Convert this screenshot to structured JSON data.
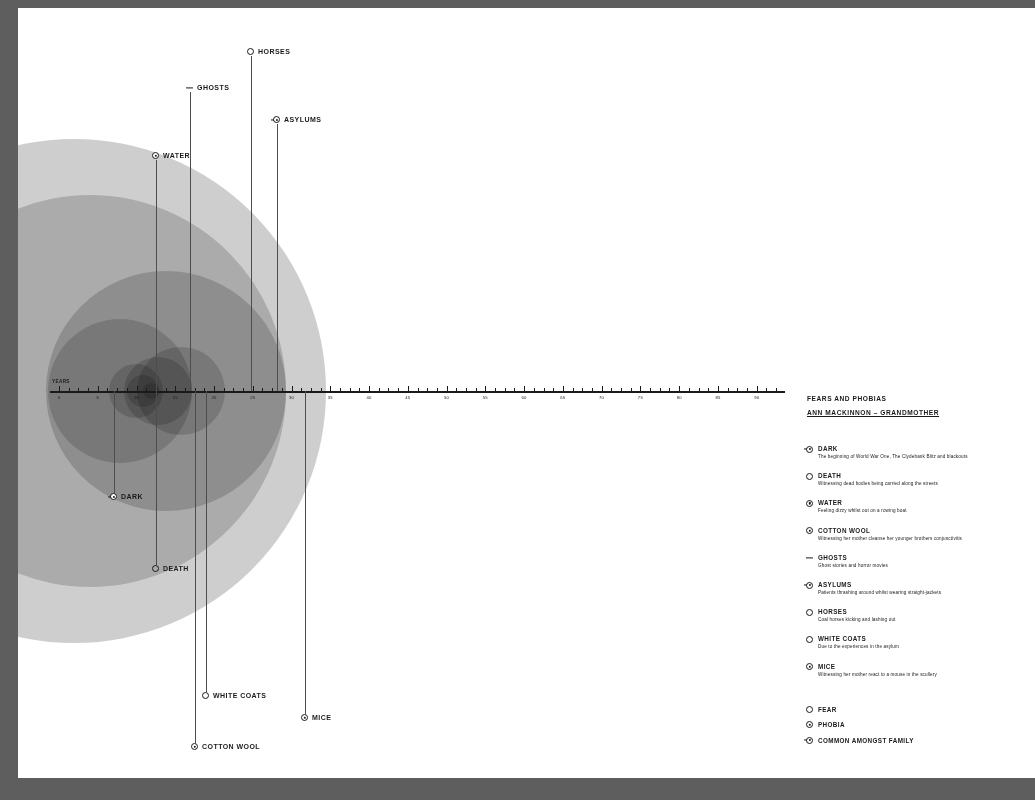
{
  "meta": {
    "canvas_width": 1035,
    "canvas_height": 800,
    "page_background": "#ffffff",
    "surround_background": "#5e5e5e",
    "bubble_color": "#6f6f6f",
    "ink_color": "#1a1a1a"
  },
  "axis": {
    "title": "YEARS",
    "labels": [
      "0",
      "5",
      "10",
      "15",
      "20",
      "25",
      "30",
      "35",
      "40",
      "45",
      "50",
      "55",
      "60",
      "65",
      "70",
      "75",
      "80",
      "85",
      "90"
    ],
    "tick_count": 76
  },
  "legend": {
    "title": "FEARS AND PHOBIAS",
    "subtitle": "ANN MACKINNON – GRANDMOTHER",
    "items": [
      {
        "name": "DARK",
        "desc": "The beginning of World War One, The Clydebank Blitz and blackouts",
        "icon": "family-icon"
      },
      {
        "name": "DEATH",
        "desc": "Witnessing dead bodies being carried along the streets",
        "icon": "fear-icon"
      },
      {
        "name": "WATER",
        "desc": "Feeling dizzy whilst out on a rowing boat",
        "icon": "phobia-icon"
      },
      {
        "name": "COTTON WOOL",
        "desc": "Witnessing her mother cleanse her younger brothers conjunctivitis",
        "icon": "phobia-icon"
      },
      {
        "name": "GHOSTS",
        "desc": "Ghost stories and horror movies",
        "icon": "dash-icon"
      },
      {
        "name": "ASYLUMS",
        "desc": "Patients thrashing around whilst wearing straight-jackets",
        "icon": "family-icon"
      },
      {
        "name": "HORSES",
        "desc": "Coal horses kicking and lashing out",
        "icon": "fear-icon"
      },
      {
        "name": "WHITE COATS",
        "desc": "Due to the experiences in the asylum",
        "icon": "fear-icon"
      },
      {
        "name": "MICE",
        "desc": "Witnessing her mother react to a mouse in the scullery",
        "icon": "phobia-icon"
      }
    ],
    "key": [
      {
        "label": "FEAR",
        "icon": "fear-icon"
      },
      {
        "label": "PHOBIA",
        "icon": "phobia-icon"
      },
      {
        "label": "COMMON AMONGST FAMILY",
        "icon": "family-icon"
      }
    ]
  },
  "callouts": [
    {
      "label": "HORSES",
      "icon": "fear-icon"
    },
    {
      "label": "GHOSTS",
      "icon": "dash-icon"
    },
    {
      "label": "ASYLUMS",
      "icon": "family-icon"
    },
    {
      "label": "WATER",
      "icon": "phobia-icon"
    },
    {
      "label": "DARK",
      "icon": "family-icon"
    },
    {
      "label": "DEATH",
      "icon": "fear-icon"
    },
    {
      "label": "WHITE COATS",
      "icon": "fear-icon"
    },
    {
      "label": "COTTON WOOL",
      "icon": "phobia-icon"
    },
    {
      "label": "MICE",
      "icon": "phobia-icon"
    }
  ],
  "chart_data": {
    "type": "scatter",
    "title": "FEARS AND PHOBIAS",
    "subtitle": "ANN MACKINNON – GRANDMOTHER",
    "xlabel": "YEARS",
    "xlim": [
      0,
      95
    ],
    "grid": false,
    "legend_position": "right",
    "note": "Each fear is a translucent circle centred on the year it began; circle diameter encodes duration/intensity.",
    "series": [
      {
        "name": "DARK",
        "x": 2,
        "radius_px": 252,
        "icon": "family-icon"
      },
      {
        "name": "DEATH",
        "x": 4,
        "radius_px": 196,
        "icon": "fear-icon"
      },
      {
        "name": "WATER",
        "x": 8,
        "radius_px": 72,
        "icon": "phobia-icon"
      },
      {
        "name": "COTTON WOOL",
        "x": 10,
        "radius_px": 27,
        "icon": "phobia-icon"
      },
      {
        "name": "GHOSTS",
        "x": 11,
        "radius_px": 16,
        "icon": "dash-icon"
      },
      {
        "name": "ASYLUMS",
        "x": 12,
        "radius_px": 8,
        "icon": "family-icon"
      },
      {
        "name": "HORSES",
        "x": 13,
        "radius_px": 34,
        "icon": "fear-icon"
      },
      {
        "name": "WHITE COATS",
        "x": 14,
        "radius_px": 120,
        "icon": "fear-icon"
      },
      {
        "name": "MICE",
        "x": 16,
        "radius_px": 44,
        "icon": "phobia-icon"
      }
    ]
  }
}
